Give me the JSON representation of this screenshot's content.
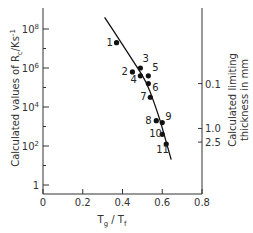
{
  "chart_data": {
    "type": "scatter",
    "title": "",
    "xlabel": "Tg / Tf",
    "ylabel": "Calculated values of Rc / Ks-1",
    "y2label": "Calculated limiting thickness in mm",
    "xlim": [
      0,
      0.8
    ],
    "ylim_log10": [
      0,
      9
    ],
    "yscale": "log",
    "grid": false,
    "legend": "none",
    "x_ticks": [
      "0",
      "0.2",
      "0.4",
      "0.6",
      "0.8"
    ],
    "y_ticks": [
      {
        "label": "1",
        "log10": 0
      },
      {
        "label": "10",
        "sup": "2",
        "log10": 2
      },
      {
        "label": "10",
        "sup": "4",
        "log10": 4
      },
      {
        "label": "10",
        "sup": "6",
        "log10": 6
      },
      {
        "label": "10",
        "sup": "8",
        "log10": 8
      }
    ],
    "y2_ticks": [
      {
        "label": "0.1",
        "log10_rc": 5.2
      },
      {
        "label": "1.0",
        "log10_rc": 2.9
      },
      {
        "label": "2.5",
        "log10_rc": 2.2
      }
    ],
    "points": [
      {
        "id": "1",
        "x": 0.37,
        "log10_rc": 7.3
      },
      {
        "id": "2",
        "x": 0.45,
        "log10_rc": 5.8
      },
      {
        "id": "3",
        "x": 0.49,
        "log10_rc": 6.0
      },
      {
        "id": "4",
        "x": 0.49,
        "log10_rc": 5.6
      },
      {
        "id": "5",
        "x": 0.53,
        "log10_rc": 5.6
      },
      {
        "id": "6",
        "x": 0.53,
        "log10_rc": 5.2
      },
      {
        "id": "7",
        "x": 0.54,
        "log10_rc": 4.5
      },
      {
        "id": "8",
        "x": 0.57,
        "log10_rc": 3.3
      },
      {
        "id": "9",
        "x": 0.6,
        "log10_rc": 3.2
      },
      {
        "id": "10",
        "x": 0.6,
        "log10_rc": 2.6
      },
      {
        "id": "11",
        "x": 0.62,
        "log10_rc": 2.1
      }
    ],
    "curve": [
      {
        "x": 0.31,
        "log10_rc": 8.6
      },
      {
        "x": 0.4,
        "log10_rc": 7.2
      },
      {
        "x": 0.47,
        "log10_rc": 6.1
      },
      {
        "x": 0.52,
        "log10_rc": 5.3
      },
      {
        "x": 0.56,
        "log10_rc": 4.2
      },
      {
        "x": 0.59,
        "log10_rc": 3.3
      },
      {
        "x": 0.62,
        "log10_rc": 2.2
      },
      {
        "x": 0.645,
        "log10_rc": 1.3
      }
    ]
  },
  "labels": {
    "xaxis_main": "T",
    "xaxis_sub1": "g",
    "xaxis_slash": " / T",
    "xaxis_sub2": "f",
    "yaxis": "Calculated values of R",
    "yaxis_sub": "c",
    "yaxis_unit": "/Ks",
    "yaxis_sup": "-1",
    "y2_line1": "Calculated limiting",
    "y2_line2": "thickness in mm"
  }
}
